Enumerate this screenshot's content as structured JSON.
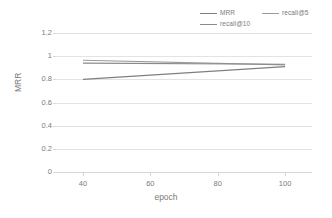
{
  "chart_data": {
    "type": "line",
    "title": "",
    "xlabel": "epoch",
    "ylabel": "MRR",
    "x": [
      40,
      100
    ],
    "xlim": [
      32,
      108
    ],
    "ylim": [
      0,
      1.2
    ],
    "xticks": [
      40,
      60,
      80,
      100
    ],
    "yticks": [
      0,
      0.2,
      0.4,
      0.6,
      0.8,
      1,
      1.2
    ],
    "ytick_labels": [
      "0",
      "0.2",
      "0.4",
      "0.6",
      "0.8",
      "1",
      "1.2"
    ],
    "xtick_labels": [
      "40",
      "60",
      "80",
      "100"
    ],
    "grid": "horizontal",
    "legend_position": "top",
    "series": [
      {
        "name": "MRR",
        "values": [
          0.8,
          0.91
        ],
        "color": "#7f7f7f"
      },
      {
        "name": "recall@5",
        "values": [
          0.965,
          0.925
        ],
        "color": "#9a9a9a"
      },
      {
        "name": "recall@10",
        "values": [
          0.94,
          0.93
        ],
        "color": "#8a8a8a"
      }
    ]
  },
  "legend": {
    "items": [
      {
        "label": "MRR"
      },
      {
        "label": "recall@5"
      },
      {
        "label": "recall@10"
      }
    ]
  },
  "axes": {
    "x_title": "epoch",
    "y_title": "MRR"
  },
  "colors": {
    "gridline": "#e3e3e3",
    "axis": "#d6d6d6",
    "text": "#7b7b7b",
    "background": "#ffffff"
  }
}
